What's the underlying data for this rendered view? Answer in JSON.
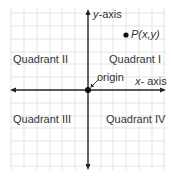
{
  "diagram": {
    "axes": {
      "x_label_var": "x",
      "x_label_rest": "- axis",
      "y_label_var": "y",
      "y_label_rest": "-axis"
    },
    "origin_label": "origin",
    "point_label": "P(x,y)",
    "quadrants": {
      "q1": "Quadrant  I",
      "q2": "Quadrant II",
      "q3": "Quadrant III",
      "q4": "Quadrant IV"
    },
    "colors": {
      "grid": "#d9d9d9",
      "axis": "#222222",
      "text": "#333333",
      "background": "#ffffff"
    }
  }
}
